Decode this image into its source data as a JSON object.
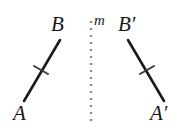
{
  "figure": {
    "background_color": "#ffffff",
    "stroke_color": "#1a1a1a",
    "mirror_color": "#8c8c8c",
    "width": 185,
    "height": 138
  },
  "labels": {
    "A": "A",
    "B": "B",
    "A_prime": "A′",
    "B_prime": "B′",
    "m": "m"
  },
  "geometry": {
    "segment_ab": {
      "x1": 24,
      "y1": 101,
      "x2": 60,
      "y2": 40,
      "stroke_width": 2.6
    },
    "segment_ab_prime": {
      "x1": 164,
      "y1": 101,
      "x2": 128,
      "y2": 40,
      "stroke_width": 2.6
    },
    "tick_ab": {
      "x1": 34,
      "y1": 66,
      "x2": 48,
      "y2": 74,
      "stroke_width": 2.0
    },
    "tick_ab_prime": {
      "x1": 140,
      "y1": 74,
      "x2": 154,
      "y2": 66,
      "stroke_width": 2.0
    },
    "mirror_line": {
      "x1": 91,
      "y1": 21,
      "x2": 91,
      "y2": 122,
      "stroke_width": 2.4,
      "dash": "2 5"
    }
  }
}
